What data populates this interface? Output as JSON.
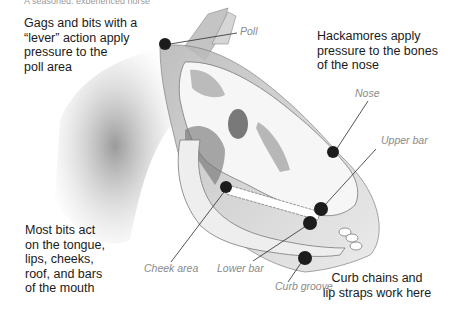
{
  "figure": {
    "top_text_fragment": "A seasoned, experienced horse",
    "captions": {
      "poll": "Gags and bits with a “lever” action apply pressure to the poll area",
      "nose": "Hackamores apply pressure to the bones of the nose",
      "mouth": "Most bits act on the tongue, lips, cheeks, roof, and bars of the mouth",
      "curb": "Curb chains and lip straps work here"
    },
    "caption_lines": {
      "poll": [
        "Gags and bits with a",
        "“lever” action apply",
        "pressure to the",
        "poll area"
      ],
      "nose": [
        "Hackamores apply",
        "pressure to the bones",
        "of the nose"
      ],
      "mouth": [
        "Most bits act",
        "on the tongue,",
        "lips, cheeks,",
        "roof, and bars",
        "of the mouth"
      ],
      "curb": [
        "Curb chains and",
        "lip straps work here"
      ]
    },
    "pressure_points": [
      {
        "id": "poll",
        "label": "Poll"
      },
      {
        "id": "nose",
        "label": "Nose"
      },
      {
        "id": "upper-bar",
        "label": "Upper bar"
      },
      {
        "id": "lower-bar",
        "label": "Lower bar"
      },
      {
        "id": "cheek-area",
        "label": "Cheek area"
      },
      {
        "id": "curb-groove",
        "label": "Curb groove"
      }
    ],
    "colors": {
      "dot": "#1c1c1c",
      "leader_line": "#2a2a2a",
      "label": "#8a8a8a",
      "caption": "#1a1a1a",
      "sketch_shade": "#9a9a9a"
    }
  }
}
